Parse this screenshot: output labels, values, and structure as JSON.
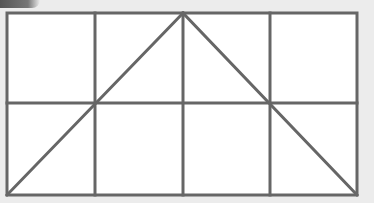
{
  "figure": {
    "grid": {
      "columns": 4,
      "rows": 2,
      "left": 7,
      "top": 13,
      "right": 357,
      "bottom": 195,
      "vertical_lines_x": [
        95,
        183,
        270
      ],
      "horizontal_lines_y": [
        103
      ]
    },
    "diagonals": [
      {
        "from": [
          7,
          195
        ],
        "to": [
          183,
          13
        ]
      },
      {
        "from": [
          183,
          13
        ],
        "to": [
          357,
          195
        ]
      }
    ],
    "colors": {
      "background": "#ececec",
      "cell_fill": "#ffffff",
      "line": "#666666"
    },
    "line_width": 3
  }
}
